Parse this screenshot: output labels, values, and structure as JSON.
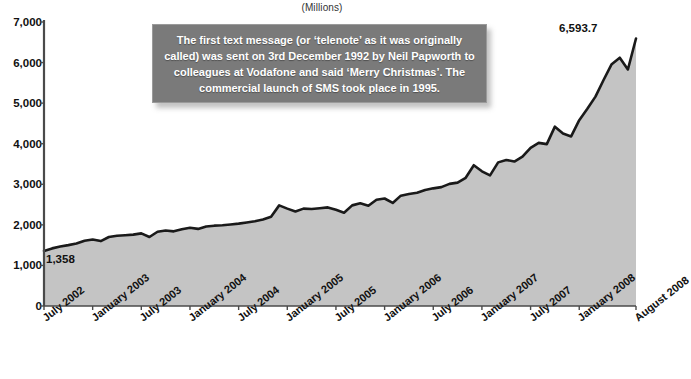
{
  "chart": {
    "units_label": "(Millions)",
    "annotation": "The first text message (or ‘telenote’ as it was originally called) was sent on 3rd December 1992 by Neil Papworth to colleagues at Vodafone and said ‘Merry Christmas’. The commercial launch of SMS took place in 1995.",
    "start_value_label": "1,358",
    "end_value_label": "6,593.7"
  },
  "chart_data": {
    "type": "area",
    "title": "",
    "subtitle": "",
    "xlabel": "",
    "ylabel": "(Millions)",
    "ylim": [
      0,
      7000
    ],
    "grid": false,
    "legend": "none",
    "line_color": "#1a1a1a",
    "fill_color": "#c4c4c4",
    "ytick_labels": [
      "0",
      "1,000",
      "2,000",
      "3,000",
      "4,000",
      "5,000",
      "6,000",
      "7,000"
    ],
    "ytick_values": [
      0,
      1000,
      2000,
      3000,
      4000,
      5000,
      6000,
      7000
    ],
    "xtick_labels": [
      "July 2002",
      "January 2003",
      "July 2003",
      "January 2004",
      "July 2004",
      "January 2005",
      "July 2005",
      "January 2006",
      "July 2006",
      "January 2007",
      "July 2007",
      "January 2008",
      "August 2008"
    ],
    "xtick_indices": [
      0,
      6,
      12,
      18,
      24,
      30,
      36,
      42,
      48,
      54,
      60,
      66,
      73
    ],
    "annotations": [
      {
        "text": "1,358",
        "index": 0,
        "value": 1358
      },
      {
        "text": "6,593.7",
        "index": 73,
        "value": 6593.7
      }
    ],
    "x": [
      "July 2002",
      "August 2002",
      "September 2002",
      "October 2002",
      "November 2002",
      "December 2002",
      "January 2003",
      "February 2003",
      "March 2003",
      "April 2003",
      "May 2003",
      "June 2003",
      "July 2003",
      "August 2003",
      "September 2003",
      "October 2003",
      "November 2003",
      "December 2003",
      "January 2004",
      "February 2004",
      "March 2004",
      "April 2004",
      "May 2004",
      "June 2004",
      "July 2004",
      "August 2004",
      "September 2004",
      "October 2004",
      "November 2004",
      "December 2004",
      "January 2005",
      "February 2005",
      "March 2005",
      "April 2005",
      "May 2005",
      "June 2005",
      "July 2005",
      "August 2005",
      "September 2005",
      "October 2005",
      "November 2005",
      "December 2005",
      "January 2006",
      "February 2006",
      "March 2006",
      "April 2006",
      "May 2006",
      "June 2006",
      "July 2006",
      "August 2006",
      "September 2006",
      "October 2006",
      "November 2006",
      "December 2006",
      "January 2007",
      "February 2007",
      "March 2007",
      "April 2007",
      "May 2007",
      "June 2007",
      "July 2007",
      "August 2007",
      "September 2007",
      "October 2007",
      "November 2007",
      "December 2007",
      "January 2008",
      "February 2008",
      "March 2008",
      "April 2008",
      "May 2008",
      "June 2008",
      "July 2008",
      "August 2008"
    ],
    "values": [
      1358,
      1420,
      1465,
      1500,
      1540,
      1610,
      1640,
      1600,
      1700,
      1730,
      1745,
      1760,
      1790,
      1700,
      1830,
      1860,
      1840,
      1890,
      1930,
      1900,
      1960,
      1980,
      1990,
      2010,
      2030,
      2060,
      2090,
      2130,
      2200,
      2480,
      2400,
      2330,
      2400,
      2390,
      2410,
      2430,
      2370,
      2300,
      2480,
      2530,
      2470,
      2620,
      2650,
      2540,
      2720,
      2760,
      2790,
      2860,
      2900,
      2930,
      3010,
      3040,
      3160,
      3470,
      3320,
      3220,
      3540,
      3600,
      3560,
      3680,
      3900,
      4020,
      3990,
      4420,
      4250,
      4180,
      4580,
      4860,
      5160,
      5570,
      5960,
      6120,
      5830,
      6593.7
    ]
  }
}
